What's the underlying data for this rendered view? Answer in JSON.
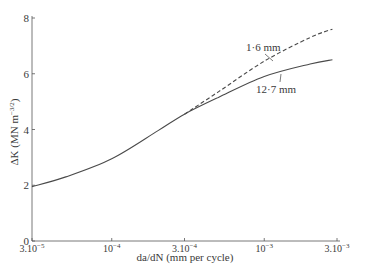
{
  "chart_data": {
    "type": "line",
    "title": "",
    "xlabel": "da/dN (mm per cycle)",
    "ylabel": "ΔK (MN m^-3/2)",
    "xscale": "log",
    "xlim": [
      3e-05,
      0.003
    ],
    "ylim": [
      0,
      8
    ],
    "grid": false,
    "legend_position": "inline annotations",
    "x_ticks": [
      {
        "value": 3e-05,
        "label": "3.10",
        "exp": "−5"
      },
      {
        "value": 0.0001,
        "label": "10",
        "exp": "−4"
      },
      {
        "value": 0.0003,
        "label": "3.10",
        "exp": "−4"
      },
      {
        "value": 0.001,
        "label": "10",
        "exp": "−3"
      },
      {
        "value": 0.003,
        "label": "3.10",
        "exp": "−3"
      }
    ],
    "y_ticks": [
      0,
      2,
      4,
      6,
      8
    ],
    "x": [
      3e-05,
      5e-05,
      0.0001,
      0.0002,
      0.0003,
      0.0005,
      0.001,
      0.002,
      0.0028
    ],
    "series": [
      {
        "name": "1·6 mm",
        "style": "dashed",
        "values": [
          1.95,
          2.3,
          2.95,
          3.95,
          4.55,
          5.35,
          6.45,
          7.3,
          7.6
        ]
      },
      {
        "name": "12·7 mm",
        "style": "solid",
        "values": [
          1.95,
          2.3,
          2.95,
          3.95,
          4.55,
          5.15,
          5.9,
          6.35,
          6.5
        ]
      }
    ],
    "annotations": [
      {
        "text": "1·6 mm",
        "points_to": "dashed curve near 10^-3"
      },
      {
        "text": "12·7 mm",
        "points_to": "solid curve near 10^-3"
      }
    ]
  },
  "labels": {
    "xlabel": "da/dN (mm per cycle)",
    "ylabel_main": "ΔK (MN m",
    "ylabel_exp": "−3/2",
    "ylabel_close": ")",
    "series_dashed": "1·6 mm",
    "series_solid": "12·7 mm"
  }
}
